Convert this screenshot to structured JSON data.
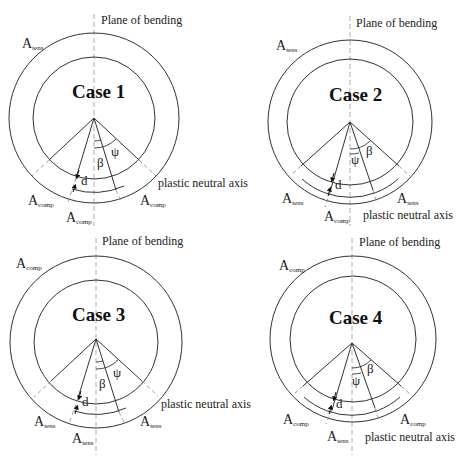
{
  "figure": {
    "panels": [
      {
        "id": "case1",
        "title": "Case 1",
        "plane_label": "Plane of bending",
        "pna_label": "plastic neutral axis",
        "area_top": {
          "base": "A",
          "sub": "tens"
        },
        "area_left": {
          "base": "A",
          "sub": "comp"
        },
        "area_right": {
          "base": "A",
          "sub": "comp"
        },
        "area_bottom": {
          "base": "A",
          "sub": "comp"
        },
        "outer_angle_symbol": "ψ",
        "inner_angle_symbol": "β",
        "thickness_symbol": "d"
      },
      {
        "id": "case2",
        "title": "Case 2",
        "plane_label": "Plane of bending",
        "pna_label": "plastic neutral axis",
        "area_top": {
          "base": "A",
          "sub": "tens"
        },
        "area_left": {
          "base": "A",
          "sub": "tens"
        },
        "area_right": {
          "base": "A",
          "sub": "tens"
        },
        "area_bottom": {
          "base": "A",
          "sub": "comp"
        },
        "outer_angle_symbol": "β",
        "inner_angle_symbol": "ψ",
        "thickness_symbol": "d"
      },
      {
        "id": "case3",
        "title": "Case 3",
        "plane_label": "Plane of bending",
        "pna_label": "plastic neutral axis",
        "area_top": {
          "base": "A",
          "sub": "comp"
        },
        "area_left": {
          "base": "A",
          "sub": "tens"
        },
        "area_right": {
          "base": "A",
          "sub": "tens"
        },
        "area_bottom": {
          "base": "A",
          "sub": "tens"
        },
        "outer_angle_symbol": "ψ",
        "inner_angle_symbol": "β",
        "thickness_symbol": "d"
      },
      {
        "id": "case4",
        "title": "Case 4",
        "plane_label": "Plane of bending",
        "pna_label": "plastic neutral axis",
        "area_top": {
          "base": "A",
          "sub": "comp"
        },
        "area_left": {
          "base": "A",
          "sub": "comp"
        },
        "area_right": {
          "base": "A",
          "sub": "comp"
        },
        "area_bottom": {
          "base": "A",
          "sub": "tens"
        },
        "outer_angle_symbol": "β",
        "inner_angle_symbol": "ψ",
        "thickness_symbol": "d"
      }
    ],
    "colors": {
      "line": "#333333",
      "dashed": "#888888",
      "text": "#222222"
    }
  }
}
